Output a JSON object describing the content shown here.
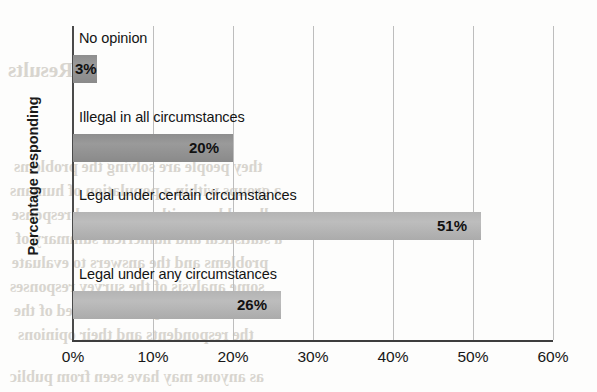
{
  "chart_data": {
    "type": "bar",
    "orientation": "horizontal",
    "title": "",
    "xlabel": "",
    "ylabel": "Percentage responding",
    "categories": [
      "No opinion",
      "Illegal in all circumstances",
      "Legal under certain circumstances",
      "Legal under any circumstances"
    ],
    "values": [
      3,
      20,
      51,
      26
    ],
    "value_labels": [
      "3%",
      "20%",
      "51%",
      "26%"
    ],
    "bar_shades": [
      "dark",
      "dark",
      "light",
      "light"
    ],
    "xlim": [
      0,
      60
    ],
    "xtick_values": [
      0,
      10,
      20,
      30,
      40,
      50,
      60
    ],
    "xtick_labels": [
      "0%",
      "10%",
      "20%",
      "30%",
      "40%",
      "50%",
      "60%"
    ],
    "grid": "vertical",
    "legend": "none",
    "colors": {
      "bar_dark": "#979797",
      "bar_light": "#b8b8b8",
      "gridline": "#bdbdbd",
      "axis": "#3d3d3d",
      "text": "#141414"
    }
  },
  "background_bleed": [
    {
      "text": "Results",
      "x": 8,
      "y": 58,
      "size": 21
    },
    {
      "text": "they people are solving the problems",
      "x": 14,
      "y": 158,
      "size": 16
    },
    {
      "text": "a groups within a population of humans",
      "x": 10,
      "y": 182,
      "size": 16
    },
    {
      "text": "all problems with a measured response",
      "x": 12,
      "y": 206,
      "size": 16
    },
    {
      "text": "a statistical and numerical summary of",
      "x": 16,
      "y": 230,
      "size": 16
    },
    {
      "text": "problems and the answers to evaluate",
      "x": 12,
      "y": 254,
      "size": 16
    },
    {
      "text": "some analysis of the survey responses",
      "x": 10,
      "y": 278,
      "size": 16
    },
    {
      "text": "for each of the questions asked of the",
      "x": 14,
      "y": 302,
      "size": 16
    },
    {
      "text": "the respondents and their opinions",
      "x": 18,
      "y": 326,
      "size": 16
    },
    {
      "text": "as anyone may have seen from public",
      "x": 10,
      "y": 368,
      "size": 16
    }
  ]
}
